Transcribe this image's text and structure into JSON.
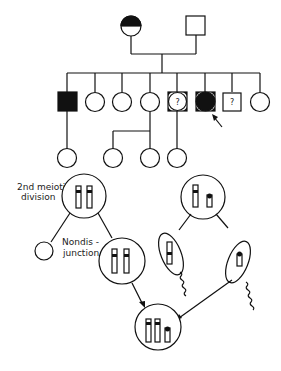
{
  "figure": {
    "type": "pedigree-and-meiosis-diagram",
    "pedigree": {
      "generation_1": [
        {
          "sex": "female",
          "status": "half-filled (top half black) - carrier"
        },
        {
          "sex": "male",
          "status": "unaffected"
        }
      ],
      "generation_2": [
        {
          "sex": "male",
          "status": "affected"
        },
        {
          "sex": "female",
          "status": "unaffected"
        },
        {
          "sex": "female",
          "status": "unaffected"
        },
        {
          "sex": "female",
          "status": "unaffected"
        },
        {
          "sex": "unknown",
          "status": "uncertain",
          "mark": "?"
        },
        {
          "sex": "unknown",
          "status": "affected",
          "proband": true
        },
        {
          "sex": "male",
          "status": "uncertain",
          "mark": "?"
        },
        {
          "sex": "female",
          "status": "unaffected"
        }
      ],
      "generation_3": [
        {
          "sex": "female",
          "parent_index": 0
        },
        {
          "sex": "female",
          "parent_index": 3
        },
        {
          "sex": "female",
          "parent_index": 3
        },
        {
          "sex": "female",
          "parent_index": 4
        }
      ],
      "question_mark": "?"
    },
    "meiosis": {
      "label_division": "2nd meiotic division",
      "label_division_line1": "2nd meiotic",
      "label_division_line2": "division",
      "label_nondisjunction_line1": "Nondis -",
      "label_nondisjunction_line2": "junction",
      "maternal_cell": "two chromatids with banded centromeres",
      "paternal_cell": "one long and one short chromosome",
      "zygote": "trisomic - three chromosomes"
    }
  }
}
